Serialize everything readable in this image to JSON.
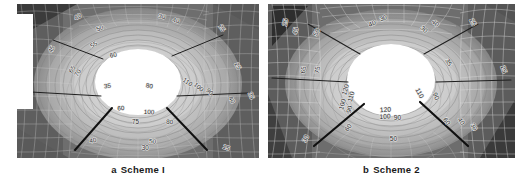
{
  "figure": {
    "type": "contour-plot-pair"
  },
  "panels": [
    {
      "id": "a",
      "caption_letter": "a",
      "caption_label": "Scheme I",
      "background": "#8d8d8d",
      "opening": {
        "shape": "circle",
        "fill": "#ffffff"
      },
      "contour_labels": [
        {
          "text": "40",
          "x": 0.255,
          "y": 0.095,
          "rot": -28
        },
        {
          "text": "50",
          "x": 0.345,
          "y": 0.17,
          "rot": -20
        },
        {
          "text": "30",
          "x": 0.597,
          "y": 0.095,
          "rot": 14
        },
        {
          "text": "40",
          "x": 0.655,
          "y": 0.12,
          "rot": 14
        },
        {
          "text": "25",
          "x": 0.84,
          "y": 0.165,
          "rot": 52
        },
        {
          "text": "45",
          "x": 0.15,
          "y": 0.3,
          "rot": -62
        },
        {
          "text": "55",
          "x": 0.322,
          "y": 0.275,
          "rot": -34
        },
        {
          "text": "60",
          "x": 0.4,
          "y": 0.345,
          "rot": -12
        },
        {
          "text": "65",
          "x": 0.235,
          "y": 0.43,
          "rot": -58
        },
        {
          "text": "70",
          "x": 0.258,
          "y": 0.455,
          "rot": -58
        },
        {
          "text": "30",
          "x": 0.053,
          "y": 0.48,
          "rot": -76
        },
        {
          "text": "25",
          "x": 0.905,
          "y": 0.41,
          "rot": 62
        },
        {
          "text": "35",
          "x": 0.375,
          "y": 0.545,
          "rot": -8
        },
        {
          "text": "80",
          "x": 0.545,
          "y": 0.545,
          "rot": 10
        },
        {
          "text": "110",
          "x": 0.7,
          "y": 0.518,
          "rot": 34
        },
        {
          "text": "100",
          "x": 0.745,
          "y": 0.55,
          "rot": 40
        },
        {
          "text": "90",
          "x": 0.79,
          "y": 0.58,
          "rot": 44
        },
        {
          "text": "35",
          "x": 0.03,
          "y": 0.64,
          "rot": -80
        },
        {
          "text": "60",
          "x": 0.43,
          "y": 0.69,
          "rot": -4
        },
        {
          "text": "100",
          "x": 0.545,
          "y": 0.715,
          "rot": 2
        },
        {
          "text": "40",
          "x": 0.88,
          "y": 0.63,
          "rot": 58
        },
        {
          "text": "25",
          "x": 0.96,
          "y": 0.6,
          "rot": 66
        },
        {
          "text": "75",
          "x": 0.49,
          "y": 0.78,
          "rot": 0
        },
        {
          "text": "80",
          "x": 0.63,
          "y": 0.78,
          "rot": 4
        },
        {
          "text": "40",
          "x": 0.315,
          "y": 0.9,
          "rot": -10
        },
        {
          "text": "50",
          "x": 0.56,
          "y": 0.905,
          "rot": 2
        },
        {
          "text": "30",
          "x": 0.53,
          "y": 0.95,
          "rot": 0
        },
        {
          "text": "15",
          "x": 0.862,
          "y": 0.945,
          "rot": 20
        }
      ]
    },
    {
      "id": "b",
      "caption_letter": "b",
      "caption_label": "Scheme 2",
      "background": "#8d8d8d",
      "opening": {
        "shape": "circle",
        "fill": "#ffffff"
      },
      "contour_labels": [
        {
          "text": "30",
          "x": 0.47,
          "y": 0.105,
          "rot": -22
        },
        {
          "text": "40",
          "x": 0.425,
          "y": 0.14,
          "rot": -22
        },
        {
          "text": "40",
          "x": 0.672,
          "y": 0.135,
          "rot": 42
        },
        {
          "text": "30",
          "x": 0.626,
          "y": 0.175,
          "rot": 42
        },
        {
          "text": "25",
          "x": 0.822,
          "y": 0.125,
          "rot": 62
        },
        {
          "text": "25",
          "x": 0.078,
          "y": 0.122,
          "rot": -78
        },
        {
          "text": "45",
          "x": 0.12,
          "y": 0.178,
          "rot": -78
        },
        {
          "text": "50",
          "x": 0.205,
          "y": 0.19,
          "rot": -62
        },
        {
          "text": "35",
          "x": 0.724,
          "y": 0.385,
          "rot": 62
        },
        {
          "text": "65",
          "x": 0.152,
          "y": 0.43,
          "rot": -82
        },
        {
          "text": "75",
          "x": 0.208,
          "y": 0.43,
          "rot": -82
        },
        {
          "text": "25",
          "x": 0.946,
          "y": 0.43,
          "rot": 70
        },
        {
          "text": "120",
          "x": 0.322,
          "y": 0.56,
          "rot": -74
        },
        {
          "text": "110",
          "x": 0.345,
          "y": 0.605,
          "rot": -74
        },
        {
          "text": "100",
          "x": 0.31,
          "y": 0.655,
          "rot": -74
        },
        {
          "text": "90",
          "x": 0.338,
          "y": 0.688,
          "rot": -74
        },
        {
          "text": "110",
          "x": 0.606,
          "y": 0.585,
          "rot": 62
        },
        {
          "text": "90",
          "x": 0.672,
          "y": 0.605,
          "rot": 66
        },
        {
          "text": "120",
          "x": 0.476,
          "y": 0.7,
          "rot": -4
        },
        {
          "text": "100",
          "x": 0.474,
          "y": 0.745,
          "rot": -2
        },
        {
          "text": "90",
          "x": 0.524,
          "y": 0.755,
          "rot": 0
        },
        {
          "text": "60",
          "x": 0.716,
          "y": 0.77,
          "rot": 56
        },
        {
          "text": "40",
          "x": 0.775,
          "y": 0.77,
          "rot": 56
        },
        {
          "text": "30",
          "x": 0.826,
          "y": 0.805,
          "rot": 60
        },
        {
          "text": "60",
          "x": 0.332,
          "y": 0.81,
          "rot": -54
        },
        {
          "text": "30",
          "x": 0.16,
          "y": 0.88,
          "rot": -62
        },
        {
          "text": "50",
          "x": 0.508,
          "y": 0.888,
          "rot": 0
        }
      ]
    }
  ],
  "colors": {
    "caption_text": "#1a1a1a",
    "page_background": "#ffffff",
    "opening_fill": "#ffffff",
    "bolt_line": "#1c1c1c",
    "mesh_line": "#dcdcdc",
    "field_dark": "#5a5a5a",
    "field_mid": "#9a9a9a",
    "field_light": "#e6e6e6"
  }
}
